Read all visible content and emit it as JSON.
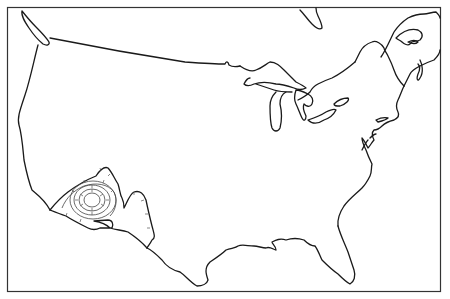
{
  "map": {
    "type": "outline map",
    "subject": "Contiguous United States with Great Lakes and surrounding Canadian coastline",
    "style": "black line drawing on white",
    "colors": {
      "background": "#ffffff",
      "line": "#1a1a1a",
      "frame": "#333333"
    },
    "features": [
      {
        "name": "map-frame"
      },
      {
        "name": "us-outline"
      },
      {
        "name": "canada-border-49th-parallel"
      },
      {
        "name": "great-lakes"
      },
      {
        "name": "puget-sound-vancouver-island"
      },
      {
        "name": "gulf-of-st-lawrence-coast"
      },
      {
        "name": "hudson-bay-fragment"
      },
      {
        "name": "hachured-depression-contours-southwest"
      }
    ]
  }
}
